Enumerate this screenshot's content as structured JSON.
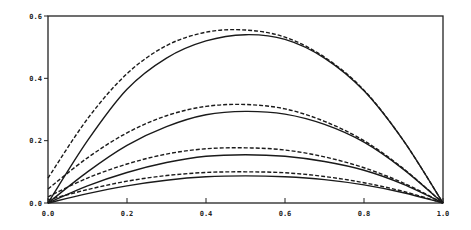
{
  "chart_data": {
    "type": "line",
    "title": "",
    "xlabel": "",
    "ylabel": "",
    "xlim": [
      0.0,
      1.0
    ],
    "ylim": [
      0.0,
      0.6
    ],
    "grid": false,
    "legend": null,
    "x_ticks": [
      "0.0",
      "0.2",
      "0.4",
      "0.6",
      "0.8",
      "1.0"
    ],
    "y_ticks": [
      "0.0",
      "0.2",
      "0.4",
      "0.6"
    ],
    "x": [
      0.0,
      0.1,
      0.2,
      0.3,
      0.4,
      0.5,
      0.6,
      0.7,
      0.8,
      0.9,
      1.0
    ],
    "series": [
      {
        "name": "solid-1",
        "style": "solid",
        "values": [
          0.0,
          0.2,
          0.365,
          0.465,
          0.52,
          0.54,
          0.525,
          0.465,
          0.36,
          0.2,
          0.0
        ]
      },
      {
        "name": "dashed-1",
        "style": "dashed",
        "values": [
          0.08,
          0.27,
          0.415,
          0.505,
          0.548,
          0.555,
          0.532,
          0.468,
          0.362,
          0.2,
          0.0
        ]
      },
      {
        "name": "solid-2",
        "style": "solid",
        "values": [
          0.0,
          0.1,
          0.185,
          0.245,
          0.283,
          0.294,
          0.285,
          0.252,
          0.195,
          0.108,
          0.0
        ]
      },
      {
        "name": "dashed-2",
        "style": "dashed",
        "values": [
          0.045,
          0.145,
          0.225,
          0.28,
          0.31,
          0.316,
          0.302,
          0.262,
          0.2,
          0.11,
          0.0
        ]
      },
      {
        "name": "solid-3",
        "style": "solid",
        "values": [
          0.0,
          0.055,
          0.098,
          0.13,
          0.15,
          0.155,
          0.15,
          0.133,
          0.105,
          0.06,
          0.0
        ]
      },
      {
        "name": "dashed-3",
        "style": "dashed",
        "values": [
          0.02,
          0.08,
          0.125,
          0.157,
          0.174,
          0.177,
          0.17,
          0.148,
          0.113,
          0.064,
          0.0
        ]
      },
      {
        "name": "solid-4",
        "style": "solid",
        "values": [
          0.0,
          0.03,
          0.055,
          0.073,
          0.084,
          0.087,
          0.084,
          0.075,
          0.058,
          0.033,
          0.0
        ]
      },
      {
        "name": "dashed-4",
        "style": "dashed",
        "values": [
          0.01,
          0.043,
          0.07,
          0.088,
          0.098,
          0.1,
          0.097,
          0.085,
          0.065,
          0.037,
          0.0
        ]
      }
    ]
  }
}
